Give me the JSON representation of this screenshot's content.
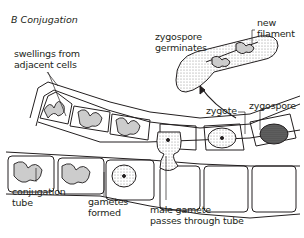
{
  "figure": {
    "title": "B  Conjugation",
    "labels": {
      "swellings": [
        "swellings from",
        "adjacent cells"
      ],
      "zygospore_germinates": [
        "zygospore",
        "germinates"
      ],
      "new_filament": [
        "new",
        "filament"
      ],
      "zygote": "zygote",
      "zygospore": "zygospore",
      "conjugation_tube": [
        "conjugation",
        "tube"
      ],
      "gametes_formed": [
        "gametes",
        "formed"
      ],
      "male_gamete": [
        "male gamete",
        "passes through tube"
      ]
    },
    "colors": {
      "line": "#231f20",
      "stipple": "#bfbfbf",
      "dark_fill": "#555555"
    }
  }
}
